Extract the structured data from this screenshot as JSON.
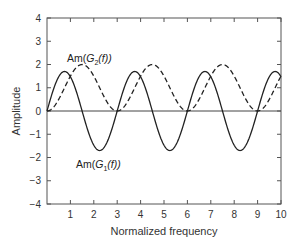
{
  "chart_data": {
    "type": "line",
    "title": "",
    "xlabel": "Normalized frequency",
    "ylabel": "Amplitude",
    "xlim": [
      0,
      10
    ],
    "ylim": [
      -4,
      4
    ],
    "xticks": [
      1,
      2,
      3,
      4,
      5,
      6,
      7,
      8,
      9,
      10
    ],
    "yticks": [
      4,
      3,
      2,
      1,
      0,
      -1,
      -2,
      -3,
      -4
    ],
    "grid": false,
    "legend": "none (inline annotations)",
    "series": [
      {
        "name": "Am(G1(f))",
        "style": "solid",
        "description": "1.7*sin(2*pi*f/3)",
        "x": [
          0,
          0.75,
          1.5,
          2.25,
          3,
          3.75,
          4.5,
          5.25,
          6,
          6.75,
          7.5,
          8.25,
          9,
          9.75,
          10
        ],
        "values": [
          0,
          1.7,
          0,
          -1.7,
          0,
          1.7,
          0,
          -1.7,
          0,
          1.7,
          0,
          -1.7,
          0,
          1.7,
          1.47
        ]
      },
      {
        "name": "Am(G2(f))",
        "style": "dashed",
        "description": "1 - cos(2*pi*f/3)",
        "x": [
          0,
          0.75,
          1.5,
          2.25,
          3,
          3.75,
          4.5,
          5.25,
          6,
          6.75,
          7.5,
          8.25,
          9,
          9.75,
          10
        ],
        "values": [
          0,
          1,
          2,
          1,
          0,
          1,
          2,
          1,
          0,
          1,
          2,
          1,
          0,
          1,
          1.5
        ]
      }
    ],
    "annotations": [
      {
        "text_prefix": "Am(",
        "symbol": "G",
        "sub": "2",
        "text_suffix": "(f))",
        "x": 1.5,
        "y": 2.6
      },
      {
        "text_prefix": "Am(",
        "symbol": "G",
        "sub": "1",
        "text_suffix": "(f))",
        "x": 2.3,
        "y": -2.3
      }
    ]
  },
  "labels": {
    "xlabel": "Normalized frequency",
    "ylabel": "Amplitude",
    "g2_prefix": "Am(",
    "g2_symbol": "G",
    "g2_sub": "2",
    "g2_suffix": "(f))",
    "g1_prefix": "Am(",
    "g1_symbol": "G",
    "g1_sub": "1",
    "g1_suffix": "(f))"
  }
}
